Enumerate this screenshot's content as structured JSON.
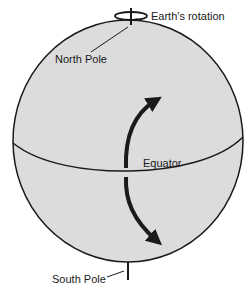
{
  "diagram": {
    "labels": {
      "rotation": "Earth's rotation",
      "north_pole": "North Pole",
      "equator": "Equator",
      "south_pole": "South Pole"
    },
    "colors": {
      "sphere_fill": "#dcdcdc",
      "stroke": "#1a1a1a",
      "background": "#ffffff"
    }
  }
}
